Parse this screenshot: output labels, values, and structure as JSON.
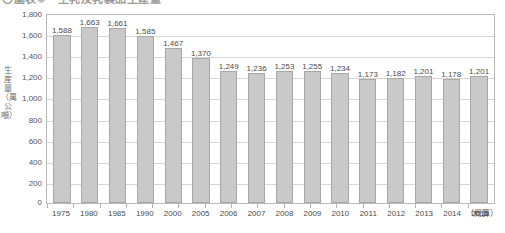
{
  "figure": {
    "title": "〇圖表⑧　生乳及乳製品生產量",
    "y_axis_title": "生産量（萬公噸）",
    "x_axis_note": "（概算）"
  },
  "chart_data": {
    "type": "bar",
    "title": "〇圖表⑧　生乳及乳製品生產量",
    "xlabel": "",
    "ylabel": "生産量（萬公噸）",
    "ylim": [
      0,
      1800
    ],
    "yticks": [
      0,
      200,
      400,
      600,
      800,
      1000,
      1200,
      1400,
      1600,
      1800
    ],
    "ytick_labels": [
      "0",
      "200",
      "400",
      "600",
      "800",
      "1,000",
      "1,200",
      "1,400",
      "1,600",
      "1,800"
    ],
    "grid": true,
    "legend": false,
    "bar_color": "#c9c9c9",
    "bar_border_color": "#a8a8a8",
    "categories": [
      "1975",
      "1980",
      "1985",
      "1990",
      "2000",
      "2005",
      "2006",
      "2007",
      "2008",
      "2009",
      "2010",
      "2011",
      "2012",
      "2013",
      "2014",
      "2015"
    ],
    "values": [
      1588,
      1663,
      1661,
      1585,
      1467,
      1370,
      1249,
      1236,
      1253,
      1255,
      1234,
      1173,
      1182,
      1201,
      1178,
      1201
    ],
    "value_labels": [
      "1,588",
      "1,663",
      "1,661",
      "1,585",
      "1,467",
      "1,370",
      "1,249",
      "1,236",
      "1,253",
      "1,255",
      "1,234",
      "1,173",
      "1,182",
      "1,201",
      "1,178",
      "1,201"
    ],
    "annotations": [
      {
        "text": "（概算）",
        "attached_to": "2015"
      }
    ]
  }
}
